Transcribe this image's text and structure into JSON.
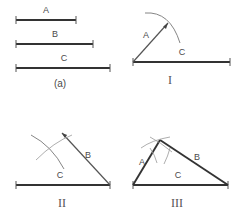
{
  "figure": {
    "title_label": "(a)",
    "panels": [
      {
        "id": "a",
        "label": "(a)"
      },
      {
        "id": "I",
        "label": "I"
      },
      {
        "id": "II",
        "label": "II"
      },
      {
        "id": "III",
        "label": "III"
      }
    ],
    "segment_labels": {
      "a": "A",
      "b": "B",
      "c": "C"
    },
    "given_segments": [
      {
        "name": "A",
        "label": "A",
        "x1": 16,
        "x2": 76,
        "y": 20,
        "length_px": 60
      },
      {
        "name": "B",
        "label": "B",
        "x1": 16,
        "x2": 93,
        "y": 44,
        "length_px": 77
      },
      {
        "name": "C",
        "label": "C",
        "x1": 16,
        "x2": 110,
        "y": 68,
        "length_px": 94
      }
    ],
    "step_one": {
      "label": "I",
      "base_label": "C",
      "arc_label": "A",
      "base": {
        "x1": 133,
        "y1": 62,
        "x2": 230,
        "y2": 62
      },
      "ray": {
        "x1": 133,
        "y1": 62,
        "x2": 168,
        "y2": 23
      }
    },
    "step_two": {
      "label": "II",
      "base_label": "C",
      "arc_label": "B",
      "base": {
        "x1": 16,
        "y1": 185,
        "x2": 110,
        "y2": 185
      },
      "ray": {
        "x1": 110,
        "y1": 185,
        "x2": 62,
        "y2": 133
      }
    },
    "step_three": {
      "label": "III",
      "side_a_label": "A",
      "side_b_label": "B",
      "side_c_label": "C",
      "apex": {
        "x": 160,
        "y": 140
      },
      "base_left": {
        "x": 133,
        "y": 185
      },
      "base_right": {
        "x": 228,
        "y": 185
      }
    },
    "colors": {
      "ink": "#333333",
      "label_ink": "#4a4a4a",
      "arc_ink": "#777777",
      "background": "#ffffff"
    }
  }
}
